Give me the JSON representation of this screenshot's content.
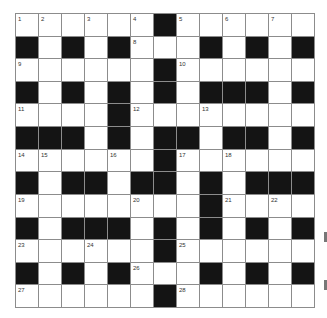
{
  "puzzle": {
    "rows": 13,
    "cols": 13,
    "layout": [
      "WWWWWWBWWWWWW",
      "BWBWBWWWBWBWB",
      "WWWWWWBWWWWWW",
      "BWBWBWBWBBBWB",
      "WWWWBWWWWWWWW",
      "BBBWBWBBWBBWB",
      "WWWWWWBWWWWWW",
      "BWBBWBBWBWBBB",
      "WWWWWWWWBWWWW",
      "BWBBBWBWBWBWB",
      "WWWWWWBWWWWWW",
      "BWBWBWWWBWBWB",
      "WWWWWWBWWWWWW"
    ],
    "numbers": [
      {
        "r": 0,
        "c": 0,
        "n": "1"
      },
      {
        "r": 0,
        "c": 1,
        "n": "2"
      },
      {
        "r": 0,
        "c": 3,
        "n": "3"
      },
      {
        "r": 0,
        "c": 5,
        "n": "4"
      },
      {
        "r": 0,
        "c": 7,
        "n": "5"
      },
      {
        "r": 0,
        "c": 9,
        "n": "6"
      },
      {
        "r": 0,
        "c": 11,
        "n": "7"
      },
      {
        "r": 1,
        "c": 5,
        "n": "8"
      },
      {
        "r": 2,
        "c": 0,
        "n": "9"
      },
      {
        "r": 2,
        "c": 7,
        "n": "10"
      },
      {
        "r": 4,
        "c": 0,
        "n": "11"
      },
      {
        "r": 4,
        "c": 5,
        "n": "12"
      },
      {
        "r": 4,
        "c": 8,
        "n": "13"
      },
      {
        "r": 6,
        "c": 0,
        "n": "14"
      },
      {
        "r": 6,
        "c": 1,
        "n": "15"
      },
      {
        "r": 6,
        "c": 4,
        "n": "16"
      },
      {
        "r": 6,
        "c": 7,
        "n": "17"
      },
      {
        "r": 6,
        "c": 9,
        "n": "18"
      },
      {
        "r": 8,
        "c": 0,
        "n": "19"
      },
      {
        "r": 8,
        "c": 5,
        "n": "20"
      },
      {
        "r": 8,
        "c": 9,
        "n": "21"
      },
      {
        "r": 8,
        "c": 11,
        "n": "22"
      },
      {
        "r": 10,
        "c": 0,
        "n": "23"
      },
      {
        "r": 10,
        "c": 3,
        "n": "24"
      },
      {
        "r": 10,
        "c": 7,
        "n": "25"
      },
      {
        "r": 11,
        "c": 5,
        "n": "26"
      },
      {
        "r": 12,
        "c": 0,
        "n": "27"
      },
      {
        "r": 12,
        "c": 7,
        "n": "28"
      }
    ]
  },
  "colors": {
    "black_cell": "#141414",
    "white_cell": "#ffffff",
    "grid_line": "#8c8c8c"
  }
}
